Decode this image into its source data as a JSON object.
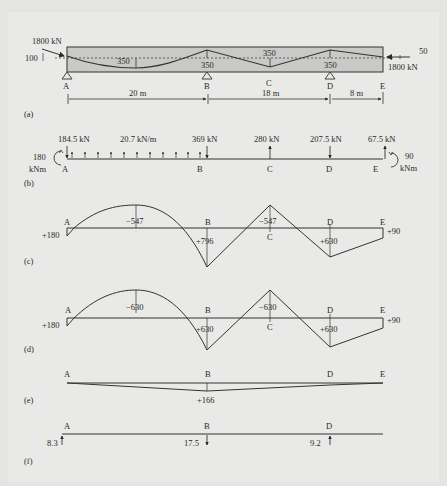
{
  "figure": {
    "panels": [
      "(a)",
      "(b)",
      "(c)",
      "(d)",
      "(e)",
      "(f)"
    ],
    "points": {
      "A": "A",
      "B": "B",
      "C": "C",
      "D": "D",
      "E": "E"
    },
    "colors": {
      "beam_fill": "#c8c8c6",
      "line": "#333333",
      "background": "#e6e6e4"
    }
  },
  "panel_a": {
    "label": "(a)",
    "left_force": "1800 kN",
    "left_ecc": "100",
    "right_force": "1800 kN",
    "right_ecc": "50",
    "drape_AB": "350",
    "drape_B": "350",
    "drape_C": "350",
    "drape_D": "350",
    "span_AB": "20 m",
    "span_BD": "18 m",
    "span_DE": "8 m"
  },
  "panel_b": {
    "label": "(b)",
    "load_A": "184.5 kN",
    "udl": "20.7 kN/m",
    "load_B": "369 kN",
    "load_C": "280 kN",
    "load_D": "207.5 kN",
    "load_E": "67.5 kN",
    "moment_A_val": "180",
    "moment_A_unit": "kNm",
    "moment_E_val": "90",
    "moment_E_unit": "kNm"
  },
  "panel_c": {
    "label": "(c)",
    "A": "+180",
    "mid_AB": "−547",
    "B": "+796",
    "C": "−547",
    "D": "+630",
    "E": "+90"
  },
  "panel_d": {
    "label": "(d)",
    "A": "+180",
    "mid_AB": "−630",
    "B": "+630",
    "C": "−630",
    "D": "+630",
    "E": "+90"
  },
  "panel_e": {
    "label": "(e)",
    "B": "+166"
  },
  "panel_f": {
    "label": "(f)",
    "R_A": "8.3",
    "R_B": "17.5",
    "R_D": "9.2"
  }
}
